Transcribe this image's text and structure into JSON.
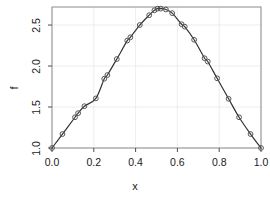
{
  "chart_data": {
    "type": "line",
    "title": "",
    "xlabel": "x",
    "ylabel": "f",
    "xlim": [
      0.0,
      1.0
    ],
    "ylim": [
      1.0,
      2.72
    ],
    "grid": true,
    "legend": null,
    "marker": "open-circle",
    "line_color": "#333333",
    "marker_color": "#555555",
    "xticks": [
      "0.0",
      "0.2",
      "0.4",
      "0.6",
      "0.8",
      "1.0"
    ],
    "xtick_values": [
      0.0,
      0.2,
      0.4,
      0.6,
      0.8,
      1.0
    ],
    "yticks": [
      "1.0",
      "1.5",
      "2.0",
      "2.5"
    ],
    "ytick_values": [
      1.0,
      1.5,
      2.0,
      2.5
    ],
    "series": [
      {
        "name": "f",
        "x": [
          0.0,
          0.05,
          0.11,
          0.125,
          0.155,
          0.21,
          0.25,
          0.265,
          0.31,
          0.36,
          0.375,
          0.42,
          0.465,
          0.49,
          0.505,
          0.52,
          0.545,
          0.575,
          0.62,
          0.635,
          0.68,
          0.73,
          0.745,
          0.79,
          0.845,
          0.895,
          0.95,
          1.0
        ],
        "y": [
          1.0,
          1.17,
          1.375,
          1.425,
          1.51,
          1.605,
          1.845,
          1.89,
          2.085,
          2.31,
          2.35,
          2.5,
          2.62,
          2.68,
          2.7,
          2.7,
          2.69,
          2.645,
          2.51,
          2.48,
          2.32,
          2.095,
          2.055,
          1.85,
          1.6,
          1.375,
          1.17,
          1.0
        ]
      }
    ]
  }
}
